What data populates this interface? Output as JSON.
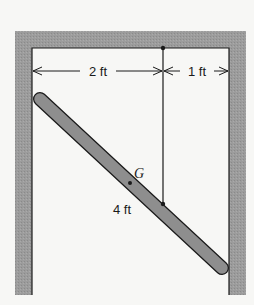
{
  "figure": {
    "type": "statics-diagram",
    "labels": {
      "dim_left": "2 ft",
      "dim_right": "1 ft",
      "rod_length": "4 ft",
      "center_of_gravity": "G"
    },
    "colors": {
      "wall": "#9a9a9a",
      "rod": "#8e8e8e",
      "line": "#1a1a1a",
      "background": "#f7f7f5"
    }
  }
}
